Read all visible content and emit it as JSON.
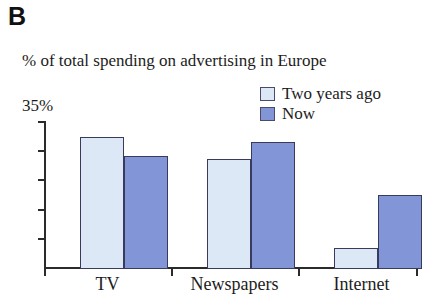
{
  "panel": {
    "label": "B"
  },
  "legend": {
    "position": "top-right",
    "entries": [
      {
        "label": "Two years ago",
        "color": "#dce8f5",
        "swatch_name": "legend-swatch-two-years-ago"
      },
      {
        "label": "Now",
        "color": "#8295d6",
        "swatch_name": "legend-swatch-now"
      }
    ]
  },
  "axis": {
    "y_top_label": "35%",
    "y_tick_count": 5
  },
  "categories_labels": {
    "tv": "TV",
    "newspapers": "Newspapers",
    "internet": "Internet"
  },
  "chart_data": {
    "type": "bar",
    "title": "% of total spending on advertising in Europe",
    "xlabel": "",
    "ylabel": "",
    "ylim": [
      0,
      35
    ],
    "ytick_labels": [
      "35%"
    ],
    "grid": false,
    "legend_position": "top-right",
    "categories": [
      "TV",
      "Newspapers",
      "Internet"
    ],
    "series": [
      {
        "name": "Two years ago",
        "color": "#dce8f5",
        "values": [
          31.4,
          26.2,
          4.8
        ]
      },
      {
        "name": "Now",
        "color": "#8295d6",
        "values": [
          26.9,
          30.2,
          17.4
        ]
      }
    ]
  }
}
